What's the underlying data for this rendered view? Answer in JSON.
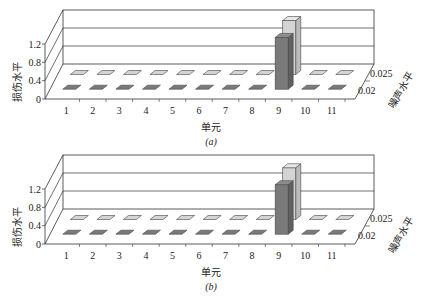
{
  "chart_data": [
    {
      "type": "bar",
      "subtype": "3d-bar",
      "caption": "(a)",
      "xlabel": "单元",
      "ylabel": "损伤水平",
      "zlabel": "噪声水平",
      "categories": [
        "1",
        "2",
        "3",
        "4",
        "5",
        "6",
        "7",
        "8",
        "9",
        "10",
        "11"
      ],
      "yticks": [
        "0",
        "0.4",
        "0.8",
        "1.2"
      ],
      "ylim": [
        0,
        1.2
      ],
      "series": [
        {
          "name": "0.02",
          "color": "#7a7a7a",
          "values": [
            0,
            0,
            0,
            0,
            0,
            0,
            0,
            0,
            1.15,
            0,
            0
          ]
        },
        {
          "name": "0.025",
          "color": "#d4d4d4",
          "values": [
            0,
            0,
            0,
            0,
            0,
            0,
            0,
            0,
            1.2,
            0,
            0
          ]
        }
      ],
      "grid": true
    },
    {
      "type": "bar",
      "subtype": "3d-bar",
      "caption": "(b)",
      "xlabel": "单元",
      "ylabel": "损伤水平",
      "zlabel": "噪声水平",
      "categories": [
        "1",
        "2",
        "3",
        "4",
        "5",
        "6",
        "7",
        "8",
        "9",
        "10",
        "11"
      ],
      "yticks": [
        "0",
        "0.4",
        "0.8",
        "1.2"
      ],
      "ylim": [
        0,
        1.2
      ],
      "series": [
        {
          "name": "0.02",
          "color": "#7a7a7a",
          "values": [
            0,
            0,
            0,
            0,
            0,
            0,
            0,
            0,
            1.1,
            0,
            0
          ]
        },
        {
          "name": "0.025",
          "color": "#d4d4d4",
          "values": [
            0,
            0,
            0,
            0,
            0,
            0,
            0,
            0,
            1.15,
            0,
            0
          ]
        }
      ],
      "grid": true
    }
  ]
}
